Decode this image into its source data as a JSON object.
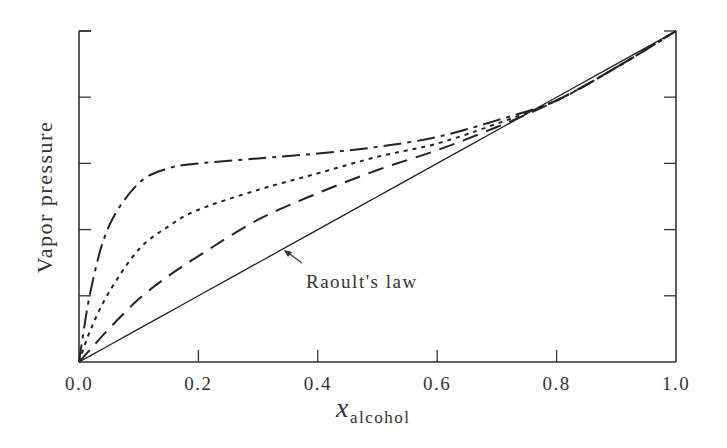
{
  "chart_data": {
    "type": "line",
    "title": "",
    "xlabel": "x",
    "xlabel_subscript": "alcohol",
    "ylabel": "Vapor pressure",
    "xlim": [
      0.0,
      1.0
    ],
    "ylim": [
      0.0,
      1.0
    ],
    "x_ticks": [
      "0.0",
      "0.2",
      "0.4",
      "0.6",
      "0.8",
      "1.0"
    ],
    "y_ticks_count": 6,
    "y_tick_labels": [],
    "grid": false,
    "legend": null,
    "x": [
      0.0,
      0.02,
      0.05,
      0.1,
      0.15,
      0.2,
      0.3,
      0.4,
      0.5,
      0.6,
      0.7,
      0.8,
      0.9,
      1.0
    ],
    "series": [
      {
        "name": "Raoult's law",
        "style": "solid",
        "values": [
          0.0,
          0.02,
          0.05,
          0.1,
          0.15,
          0.2,
          0.3,
          0.4,
          0.5,
          0.6,
          0.7,
          0.8,
          0.9,
          1.0
        ]
      },
      {
        "name": "dashed",
        "style": "dashed",
        "values": [
          0.0,
          0.04,
          0.1,
          0.19,
          0.26,
          0.32,
          0.43,
          0.51,
          0.58,
          0.64,
          0.71,
          0.79,
          0.89,
          1.0
        ]
      },
      {
        "name": "dotted",
        "style": "dotted",
        "values": [
          0.0,
          0.1,
          0.21,
          0.34,
          0.41,
          0.46,
          0.52,
          0.57,
          0.62,
          0.66,
          0.72,
          0.79,
          0.89,
          1.0
        ]
      },
      {
        "name": "dash-dot",
        "style": "dashdot",
        "values": [
          0.0,
          0.22,
          0.41,
          0.54,
          0.585,
          0.6,
          0.615,
          0.63,
          0.65,
          0.68,
          0.73,
          0.79,
          0.89,
          1.0
        ]
      }
    ],
    "annotations": [
      {
        "text": "Raoult's law",
        "arrow_to": [
          0.345,
          0.335
        ]
      }
    ]
  },
  "labels": {
    "ylabel": "Vapor pressure",
    "xlabel_main": "x",
    "xlabel_sub": "alcohol",
    "raoult": "Raoult's law",
    "xticks": [
      "0.0",
      "0.2",
      "0.4",
      "0.6",
      "0.8",
      "1.0"
    ]
  }
}
